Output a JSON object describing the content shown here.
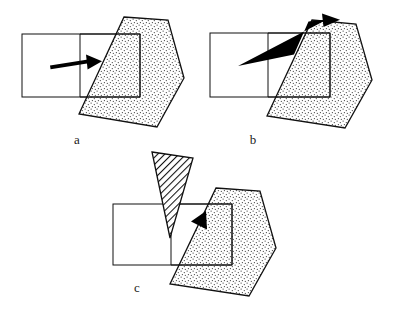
{
  "figure": {
    "background_color": "#ffffff",
    "line_color": "#111111",
    "arrow_color": "#000000",
    "stipple_fill_color": "#f2f2f2",
    "hatch_fill_color": "#ffffff",
    "width": 396,
    "height": 314
  },
  "panels": [
    {
      "id": "panel-a",
      "label": "a",
      "label_x": 77,
      "label_y": 144,
      "caption_note": "Horizontal arrow pointing right into the stippled block",
      "rectangle": {
        "name": "frame-rectangle",
        "points": "22,34 109,34 109,97 22,97",
        "divider_x": 80,
        "divider_top_y": 34,
        "divider_bottom_y": 97
      },
      "inner_rectangle": {
        "name": "inner-rectangle",
        "points": "80,34 140,34 140,97 80,97"
      },
      "block": {
        "name": "stippled-block",
        "points": "124,17 168,20 184,78 157,127 79,114"
      },
      "arrows": [
        {
          "name": "horizontal-arrow",
          "kind": "straight",
          "path": "50,67 99,60",
          "head_at": "99,60",
          "direction": "right"
        }
      ],
      "wedge": null
    },
    {
      "id": "panel-b",
      "label": "b",
      "label_x": 253,
      "label_y": 144,
      "caption_note": "Bent arrow deflecting upward and over the top of the block",
      "rectangle": {
        "name": "frame-rectangle",
        "points": "210,33 296,33 296,97 210,97",
        "divider_x": 268,
        "divider_top_y": 33,
        "divider_bottom_y": 97
      },
      "inner_rectangle": {
        "name": "inner-rectangle",
        "points": "268,33 330,33 330,97 268,97"
      },
      "block": {
        "name": "stippled-block",
        "points": "312,20 356,24 372,80 345,128 267,116"
      },
      "arrows": [
        {
          "name": "deflected-arrow",
          "kind": "polyline",
          "path": "238,66 295,54 309,20 337,18",
          "head_at": "337,18",
          "direction": "right"
        }
      ],
      "wedge": null
    },
    {
      "id": "panel-c",
      "label": "c",
      "label_x": 137,
      "label_y": 292,
      "caption_note": "V-shaped arrow rebounding upward with hatched wedge ejected",
      "rectangle": {
        "name": "frame-rectangle",
        "points": "113,204 200,204 200,265 113,265",
        "divider_x": 171,
        "divider_top_y": 204,
        "divider_bottom_y": 265
      },
      "inner_rectangle": {
        "name": "inner-rectangle",
        "points": "171,204 232,204 232,265 171,265"
      },
      "block": {
        "name": "stippled-block",
        "points": "216,188 260,191 276,248 249,296 170,284"
      },
      "arrows": [
        {
          "name": "incoming-arrow-segment",
          "kind": "polyline",
          "path": "140,236 180,260",
          "head_at": null,
          "direction": "down-right"
        },
        {
          "name": "rebound-arrow",
          "kind": "polyline",
          "path": "180,260 203,214",
          "head_at": "203,214",
          "direction": "up-right"
        }
      ],
      "wedge": {
        "name": "hatched-wedge",
        "points": "152,152 193,158 170,238",
        "hatch_angle_deg": 45,
        "hatch_spacing": 5
      }
    }
  ],
  "legend_keys": {
    "stipple_meaning": "stippled block",
    "hatch_meaning": "hatched wedge",
    "arrow_meaning": "motion direction"
  }
}
